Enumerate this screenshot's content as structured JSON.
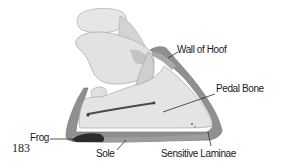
{
  "figure": {
    "number": "183",
    "labels": {
      "wall": "Wall of Hoof",
      "pedal": "Pedal Bone",
      "frog": "Frog",
      "sole": "Sole",
      "laminae": "Sensitive Laminae"
    }
  },
  "colors": {
    "background": "#ffffff",
    "bone": "#e4e4e2",
    "bone_shadow": "#bdbdbb",
    "wall": "#8f8f8d",
    "wall_light": "#a9a9a7",
    "frog": "#2b2b2b",
    "text": "#1a1a1a"
  }
}
